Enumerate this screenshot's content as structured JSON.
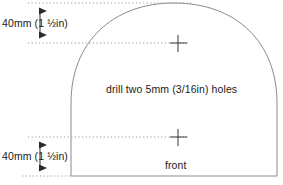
{
  "drawing": {
    "title": "Arched front panel drilling template",
    "stroke_color": "#7a7a7a",
    "text_color": "#1a1a1a",
    "background_color": "#ffffff",
    "labels": {
      "dimension_top": "40mm (1 ½in)",
      "dimension_bottom": "40mm (1 ½in)",
      "drill_note": "drill two 5mm (3/16in) holes",
      "front": "front"
    },
    "dimensions": {
      "top_offset_mm": 40,
      "top_offset_in": "1 1/2",
      "bottom_offset_mm": 40,
      "bottom_offset_in": "1 1/2",
      "hole_diameter_mm": 5,
      "hole_diameter_in": "3/16",
      "hole_count": 2
    },
    "geometry": {
      "panel_left_x": 71,
      "panel_right_x": 277,
      "panel_bottom_y": 176,
      "arch_spring_y": 100,
      "arch_apex_y": 3,
      "arch_center_x": 174,
      "hole_top": {
        "x": 178,
        "y": 43
      },
      "hole_bottom": {
        "x": 178,
        "y": 137
      },
      "arrow_x": 40,
      "top_arrow_from_y": 4,
      "top_arrow_to_y": 42,
      "bottom_arrow_from_y": 137,
      "bottom_arrow_to_y": 175
    }
  }
}
